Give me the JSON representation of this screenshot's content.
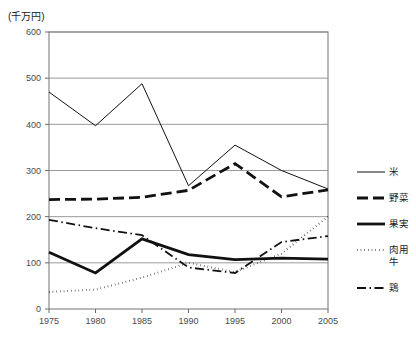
{
  "chart_data": {
    "type": "line",
    "title": "",
    "unit_label": "(千万円)",
    "xlabel": "",
    "ylabel": "",
    "x": [
      1975,
      1980,
      1985,
      1990,
      1995,
      2000,
      2005
    ],
    "xtick_labels": [
      "1975",
      "1980",
      "1985",
      "1990",
      "1995",
      "2000",
      "2005"
    ],
    "ytick_labels": [
      "0",
      "100",
      "200",
      "300",
      "400",
      "500",
      "600"
    ],
    "ytick_values": [
      0,
      100,
      200,
      300,
      400,
      500,
      600
    ],
    "ylim": [
      0,
      600
    ],
    "grid": true,
    "legend_position": "right",
    "series": [
      {
        "name": "米",
        "style": "solid-thin",
        "values": [
          470,
          397,
          488,
          267,
          355,
          300,
          260
        ]
      },
      {
        "name": "野菜",
        "style": "dashed-thick",
        "values": [
          237,
          238,
          242,
          257,
          315,
          243,
          258
        ]
      },
      {
        "name": "果実",
        "style": "solid-thick",
        "values": [
          123,
          78,
          152,
          118,
          107,
          110,
          108
        ]
      },
      {
        "name": "肉用牛",
        "style": "dotted",
        "values": [
          37,
          42,
          68,
          100,
          80,
          120,
          200
        ]
      },
      {
        "name": "鶏",
        "style": "dash-dot",
        "values": [
          193,
          175,
          160,
          90,
          78,
          145,
          158
        ]
      }
    ]
  },
  "legend": {
    "items": [
      {
        "label": "米",
        "label_line2": ""
      },
      {
        "label": "野菜",
        "label_line2": ""
      },
      {
        "label": "果実",
        "label_line2": ""
      },
      {
        "label": "肉用",
        "label_line2": "牛"
      },
      {
        "label": "鶏",
        "label_line2": ""
      }
    ]
  },
  "colors": {
    "ink": "#111111",
    "grid": "#9a9a9a",
    "frame": "#8a8a8a",
    "tick_text": "#4a4a4a"
  }
}
